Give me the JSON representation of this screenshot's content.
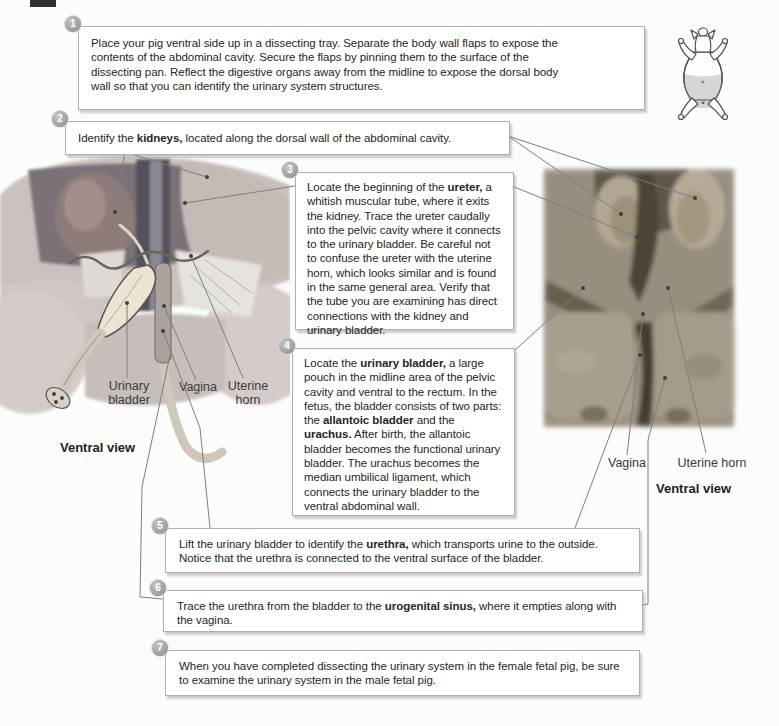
{
  "page_type": "dissection-manual-page",
  "topic": "Urinary system dissection, female fetal pig",
  "colors": {
    "step_circle": "#a7a7a7",
    "box_border": "#b3ada7",
    "leader_line": "#7e7e7e",
    "header_fragment": "#2f2f2f"
  },
  "steps": [
    {
      "num": "1",
      "segments": [
        {
          "t": "Place your pig ventral side up in a dissecting tray. Separate the body wall flaps to expose the contents of the abdominal cavity. Secure the flaps by pinning them to the surface of the dissecting pan. Reflect the digestive organs away from the midline to expose the dorsal body wall so that you can identify the urinary system structures.",
          "b": false
        }
      ]
    },
    {
      "num": "2",
      "segments": [
        {
          "t": "Identify the ",
          "b": false
        },
        {
          "t": "kidneys,",
          "b": true
        },
        {
          "t": " located along the dorsal wall of the abdominal cavity.",
          "b": false
        }
      ]
    },
    {
      "num": "3",
      "segments": [
        {
          "t": "Locate the beginning of the ",
          "b": false
        },
        {
          "t": "ureter,",
          "b": true
        },
        {
          "t": " a whitish muscular tube, where it exits the kidney. Trace the ureter caudally into the pelvic cavity where it connects to the urinary bladder. Be careful not to confuse the ureter with the uterine horn, which looks similar and is found in the same general area. Verify that the tube you are examining has direct connections with the kidney and urinary bladder.",
          "b": false
        }
      ]
    },
    {
      "num": "4",
      "segments": [
        {
          "t": "Locate the ",
          "b": false
        },
        {
          "t": "urinary bladder,",
          "b": true
        },
        {
          "t": " a large pouch in the midline area of the pelvic cavity and ventral to the rectum. In the fetus, the bladder consists of two parts: the ",
          "b": false
        },
        {
          "t": "allantoic bladder",
          "b": true
        },
        {
          "t": " and the ",
          "b": false
        },
        {
          "t": "urachus.",
          "b": true
        },
        {
          "t": " After birth, the allantoic bladder becomes the functional urinary bladder. The urachus becomes the median umbilical ligament, which connects the urinary bladder to the ventral abdominal wall.",
          "b": false
        }
      ]
    },
    {
      "num": "5",
      "segments": [
        {
          "t": "Lift the urinary bladder to identify the ",
          "b": false
        },
        {
          "t": "urethra,",
          "b": true
        },
        {
          "t": " which transports urine to the outside. Notice that the urethra is connected to the ventral surface of the bladder.",
          "b": false
        }
      ]
    },
    {
      "num": "6",
      "segments": [
        {
          "t": "Trace the urethra from the bladder to the ",
          "b": false
        },
        {
          "t": "urogenital sinus,",
          "b": true
        },
        {
          "t": " where it empties along with the vagina.",
          "b": false
        }
      ]
    },
    {
      "num": "7",
      "segments": [
        {
          "t": "When you have completed dissecting the urinary system in the female fetal pig, be sure to examine the urinary system in the male fetal pig.",
          "b": false
        }
      ]
    }
  ],
  "left_figure": {
    "caption": "Ventral view",
    "labels": {
      "bladder": "Urinary bladder",
      "vagina": "Vagina",
      "uterine_horn": "Uterine horn"
    }
  },
  "right_figure": {
    "caption": "Ventral view",
    "labels": {
      "vagina": "Vagina",
      "uterine_horn": "Uterine horn"
    }
  },
  "icons": {
    "pig": "pig-ventral-icon"
  }
}
